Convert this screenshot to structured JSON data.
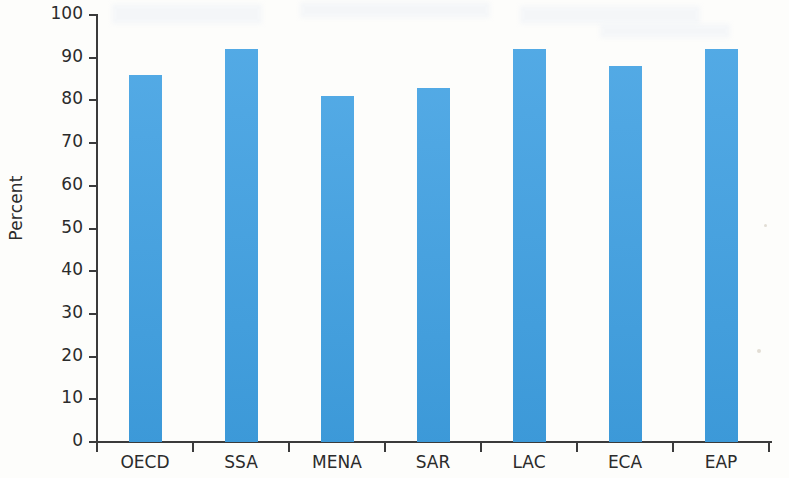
{
  "chart_data": {
    "type": "bar",
    "title": "",
    "subtitle": "",
    "xlabel": "",
    "ylabel": "Percent",
    "categories": [
      "OECD",
      "SSA",
      "MENA",
      "SAR",
      "LAC",
      "ECA",
      "EAP"
    ],
    "values": [
      86,
      92,
      81,
      83,
      92,
      88,
      92
    ],
    "series": [
      {
        "name": "Percent",
        "values": [
          86,
          92,
          81,
          83,
          92,
          88,
          92
        ]
      }
    ],
    "ylim": [
      0,
      100
    ],
    "yticks": [
      0,
      10,
      20,
      30,
      40,
      50,
      60,
      70,
      80,
      90,
      100
    ],
    "ytick_labels": [
      "0",
      "10",
      "20",
      "30",
      "40",
      "50",
      "60",
      "70",
      "80",
      "90",
      "100"
    ],
    "grid": false,
    "legend": null,
    "legend_position": "none",
    "bar_color": "#3fa0e2",
    "axis_color": "#3b3b3b",
    "background_color": "#fdfdfb",
    "annotations": []
  }
}
